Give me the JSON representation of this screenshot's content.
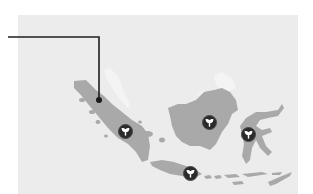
{
  "map": {
    "region": "Indonesia",
    "background_color": "#ececec",
    "land_color": "#a9a9a9",
    "highlight_land_color": "#f4f4f4",
    "marker_color": "#2b2b2b",
    "marker_icon": "plant-sprout-icon",
    "islands": [
      "Sumatra",
      "Borneo",
      "Sulawesi",
      "Java",
      "Lesser Sunda Islands"
    ],
    "markers": [
      {
        "name": "Sumatra",
        "x": 125,
        "y": 131,
        "icon": "plant-sprout-icon"
      },
      {
        "name": "Borneo",
        "x": 209,
        "y": 122,
        "icon": "plant-sprout-icon"
      },
      {
        "name": "Sulawesi",
        "x": 248,
        "y": 134,
        "icon": "plant-sprout-icon"
      },
      {
        "name": "Java",
        "x": 190,
        "y": 173,
        "icon": "plant-sprout-icon"
      }
    ],
    "callout": {
      "line_color": "#1f1f1f",
      "start": {
        "x": 8,
        "y": 37
      },
      "corner": {
        "x": 99,
        "y": 37
      },
      "end": {
        "x": 99,
        "y": 100
      }
    }
  }
}
